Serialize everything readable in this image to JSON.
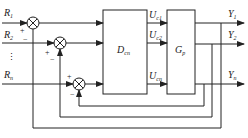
{
  "diagram": {
    "type": "multivariable feedback control block diagram",
    "inputs": [
      {
        "name": "R",
        "sub": "1"
      },
      {
        "name": "R",
        "sub": "2"
      },
      {
        "name": "R",
        "sub": "n"
      }
    ],
    "ellipsis": "⋮",
    "controller": {
      "name": "D",
      "sub": "cn"
    },
    "plant": {
      "name": "G",
      "sub": "p"
    },
    "control_signals": [
      {
        "name": "U",
        "sub": "c1"
      },
      {
        "name": "U",
        "sub": "c2"
      },
      {
        "name": "U",
        "sub": "cn"
      }
    ],
    "outputs": [
      {
        "name": "Y",
        "sub": "1"
      },
      {
        "name": "Y",
        "sub": "2"
      },
      {
        "name": "Y",
        "sub": "n"
      }
    ],
    "signs": {
      "plus": "+",
      "minus": "−"
    },
    "colors": {
      "line": "#222222",
      "background": "#ffffff"
    }
  }
}
